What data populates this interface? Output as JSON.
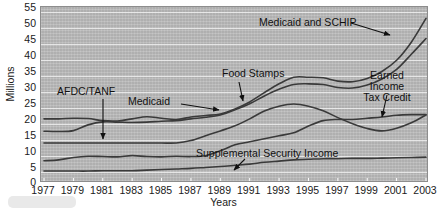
{
  "chart_data": {
    "type": "line",
    "title": "",
    "xlabel": "Years",
    "ylabel": "Millions",
    "xlim": [
      1977,
      2003
    ],
    "ylim": [
      0,
      55
    ],
    "ytick_step": 5,
    "grid": true,
    "legend_position": "inline-annotations",
    "x": [
      1977,
      1978,
      1979,
      1980,
      1981,
      1982,
      1983,
      1984,
      1985,
      1986,
      1987,
      1988,
      1989,
      1990,
      1991,
      1992,
      1993,
      1994,
      1995,
      1996,
      1997,
      1998,
      1999,
      2000,
      2001,
      2002,
      2003
    ],
    "yticks": [
      0,
      5,
      10,
      15,
      20,
      25,
      30,
      35,
      40,
      45,
      50,
      55
    ],
    "xticks": [
      1977,
      1979,
      1981,
      1983,
      1985,
      1987,
      1989,
      1991,
      1993,
      1995,
      1997,
      1999,
      2001,
      2003
    ],
    "series": [
      {
        "name": "Medicaid and SCHIP",
        "values": [
          19.6,
          19.6,
          19.8,
          19.7,
          19.0,
          18.9,
          19.6,
          20.3,
          19.8,
          19.4,
          20.2,
          20.7,
          21.2,
          22.9,
          25.2,
          28.3,
          31.2,
          33.4,
          33.4,
          33.2,
          32.1,
          31.9,
          33.0,
          35.3,
          39.0,
          45.0,
          52.9
        ]
      },
      {
        "name": "Medicaid",
        "values": [
          15.5,
          15.4,
          15.7,
          17.6,
          18.6,
          18.5,
          18.4,
          18.5,
          18.8,
          19.0,
          19.6,
          20.1,
          20.9,
          22.6,
          24.6,
          27.2,
          29.4,
          31.0,
          31.2,
          31.0,
          30.0,
          29.8,
          30.8,
          32.8,
          36.0,
          41.0,
          46.2
        ]
      },
      {
        "name": "Food Stamps",
        "values": [
          11.6,
          11.6,
          11.6,
          11.6,
          11.6,
          11.6,
          11.6,
          11.6,
          11.6,
          11.6,
          12.4,
          14.0,
          15.6,
          17.3,
          19.6,
          22.2,
          23.8,
          24.5,
          23.8,
          22.3,
          20.0,
          18.0,
          16.4,
          15.6,
          16.5,
          18.3,
          20.9
        ]
      },
      {
        "name": "Earned Income Tax Credit",
        "values": [
          5.7,
          6.0,
          6.8,
          7.2,
          7.1,
          7.0,
          7.4,
          7.1,
          7.0,
          7.2,
          7.1,
          7.4,
          9.0,
          11.0,
          12.0,
          13.0,
          14.0,
          15.0,
          17.2,
          19.0,
          19.4,
          19.4,
          19.8,
          20.2,
          20.8,
          21.0,
          21.0
        ]
      },
      {
        "name": "Supplemental Security Income",
        "values": [
          2.3,
          2.3,
          2.3,
          2.3,
          2.4,
          2.4,
          2.4,
          2.6,
          2.8,
          3.0,
          3.2,
          3.5,
          3.8,
          4.2,
          4.6,
          5.2,
          5.6,
          6.0,
          6.2,
          6.4,
          6.4,
          6.5,
          6.5,
          6.6,
          6.7,
          6.8,
          6.9
        ]
      }
    ],
    "annotations": [
      {
        "id": "afdc-tanf",
        "text": "AFDC/TANF",
        "points_to": "flat-line-near-11.6"
      },
      {
        "id": "medicaid",
        "text": "Medicaid",
        "points_to": "second-rising-line"
      },
      {
        "id": "food-stamps",
        "text": "Food Stamps",
        "points_to": "third-line"
      },
      {
        "id": "medicaid-schip",
        "text": "Medicaid and SCHIP",
        "points_to": "top-rising-line"
      },
      {
        "id": "earned-income-tax-credit",
        "text": "Earned Income Tax Credit",
        "line1": "Earned Income",
        "line2": "Tax Credit",
        "points_to": "fourth-line"
      },
      {
        "id": "supplemental-security-income",
        "text": "Supplemental Security Income",
        "points_to": "bottom-line"
      }
    ],
    "colors": {
      "plot_background": "#b9b9b9",
      "gridline": "#efefef",
      "line": "#3a3a3a",
      "text": "#111111",
      "frame_border": "#8d8d8d"
    }
  }
}
